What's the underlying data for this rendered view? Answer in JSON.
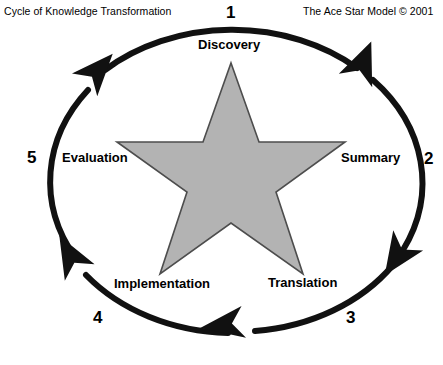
{
  "titles": {
    "left": "Cycle of Knowledge Transformation",
    "right": "The Ace Star Model © 2001"
  },
  "colors": {
    "background": "#ffffff",
    "stroke": "#111111",
    "star_fill": "#b3b3b3",
    "star_stroke": "#4d4d4d",
    "text": "#000000"
  },
  "diagram": {
    "type": "cycle",
    "shape": "five-point-star-in-ellipse",
    "direction": "clockwise",
    "stages": [
      {
        "number": "1",
        "label": "Discovery"
      },
      {
        "number": "2",
        "label": "Summary"
      },
      {
        "number": "3",
        "label": "Translation"
      },
      {
        "number": "4",
        "label": "Implementation"
      },
      {
        "number": "5",
        "label": "Evaluation"
      }
    ],
    "arrow_count": 5
  }
}
